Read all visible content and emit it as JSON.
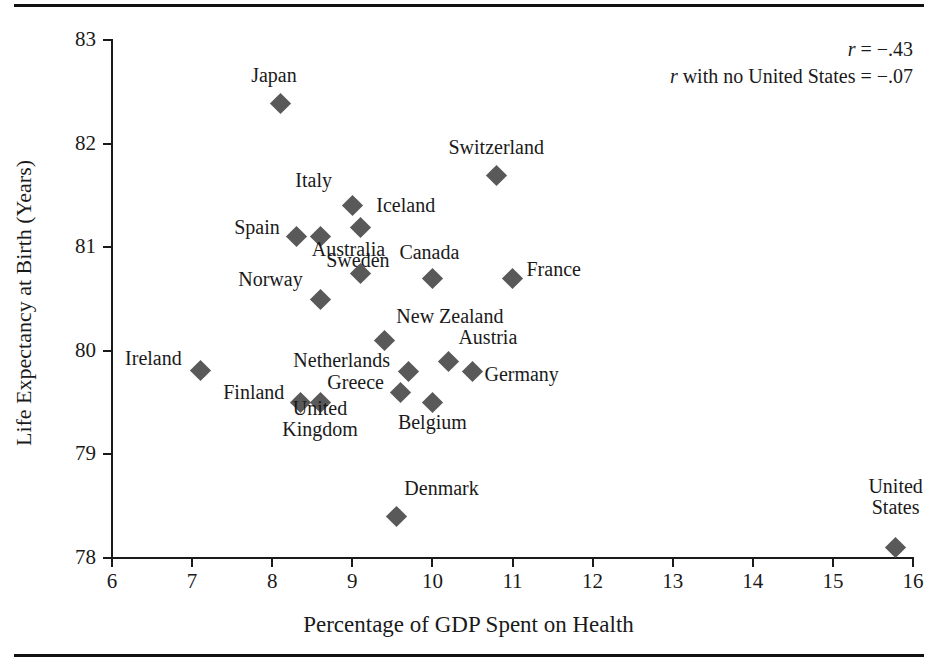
{
  "figure": {
    "x_axis_title": "Percentage of GDP Spent on Health",
    "y_axis_title": "Life Expectancy at Birth (Years)",
    "stat_r": "r = −.43",
    "stat_r_no_us": "r with no United States = −.07",
    "stat_r_symbol": "r",
    "stat_r_value": " = −.43",
    "stat_r_no_us_text": " with no United States = −.07",
    "marker_color": "#595959",
    "axis_color": "#1a1a1a"
  },
  "chart_data": {
    "type": "scatter",
    "title": "",
    "xlabel": "Percentage of GDP Spent on Health",
    "ylabel": "Life Expectancy at Birth (Years)",
    "xlim": [
      6,
      16
    ],
    "ylim": [
      78,
      83
    ],
    "xticks": [
      6,
      7,
      8,
      9,
      10,
      11,
      12,
      13,
      14,
      15,
      16
    ],
    "yticks": [
      78,
      79,
      80,
      81,
      82,
      83
    ],
    "xtick_labels": [
      "6",
      "7",
      "8",
      "9",
      "10",
      "11",
      "12",
      "13",
      "14",
      "15",
      "16"
    ],
    "ytick_labels": [
      "78",
      "79",
      "80",
      "81",
      "82",
      "83"
    ],
    "grid": false,
    "legend": "none",
    "annotations": [
      "r = −.43",
      "r with no United States = −.07"
    ],
    "correlation": -0.43,
    "correlation_without_united_states": -0.07,
    "points": [
      {
        "label": "Japan",
        "x": 8.1,
        "y": 82.39,
        "lx": -6,
        "ly": -30,
        "align": "center"
      },
      {
        "label": "Switzerland",
        "x": 10.8,
        "y": 81.69,
        "lx": 0,
        "ly": -30,
        "align": "center"
      },
      {
        "label": "Italy",
        "x": 9.0,
        "y": 81.4,
        "lx": -20,
        "ly": -27,
        "align": "right"
      },
      {
        "label": "Iceland",
        "x": 9.1,
        "y": 81.19,
        "lx": 16,
        "ly": -24,
        "align": "left"
      },
      {
        "label": "Spain",
        "x": 8.3,
        "y": 81.1,
        "lx": -16,
        "ly": -11,
        "align": "right"
      },
      {
        "label": "Sweden",
        "x": 8.6,
        "y": 81.1,
        "lx": 6,
        "ly": 22,
        "align": "left"
      },
      {
        "label": "Australia",
        "x": 9.1,
        "y": 80.75,
        "lx": -12,
        "ly": -26,
        "align": "center"
      },
      {
        "label": "Canada",
        "x": 10.0,
        "y": 80.7,
        "lx": -3,
        "ly": -28,
        "align": "center"
      },
      {
        "label": "France",
        "x": 11.0,
        "y": 80.7,
        "lx": 14,
        "ly": -11,
        "align": "left"
      },
      {
        "label": "Norway",
        "x": 8.6,
        "y": 80.5,
        "lx": -18,
        "ly": -22,
        "align": "right"
      },
      {
        "label": "New Zealand",
        "x": 9.4,
        "y": 80.1,
        "lx": 12,
        "ly": -26,
        "align": "left"
      },
      {
        "label": "Austria",
        "x": 10.2,
        "y": 79.9,
        "lx": 10,
        "ly": -26,
        "align": "left"
      },
      {
        "label": "Germany",
        "x": 10.5,
        "y": 79.8,
        "lx": 12,
        "ly": 1,
        "align": "left"
      },
      {
        "label": "Netherlands",
        "x": 9.7,
        "y": 79.8,
        "lx": -18,
        "ly": -13,
        "align": "right"
      },
      {
        "label": "Ireland",
        "x": 7.1,
        "y": 79.81,
        "lx": -18,
        "ly": -14,
        "align": "right"
      },
      {
        "label": "Greece",
        "x": 9.6,
        "y": 79.6,
        "lx": -16,
        "ly": -12,
        "align": "right"
      },
      {
        "label": "Finland",
        "x": 8.35,
        "y": 79.5,
        "lx": -16,
        "ly": -12,
        "align": "right"
      },
      {
        "label": "United\nKingdom",
        "x": 8.6,
        "y": 79.5,
        "lx": 0,
        "ly": 14,
        "align": "center"
      },
      {
        "label": "Belgium",
        "x": 10.0,
        "y": 79.5,
        "lx": 0,
        "ly": 18,
        "align": "center"
      },
      {
        "label": "Denmark",
        "x": 9.55,
        "y": 78.4,
        "lx": 8,
        "ly": -30,
        "align": "left"
      },
      {
        "label": "United\nStates",
        "x": 15.78,
        "y": 78.1,
        "lx": 0,
        "ly": -53,
        "align": "center"
      }
    ]
  }
}
